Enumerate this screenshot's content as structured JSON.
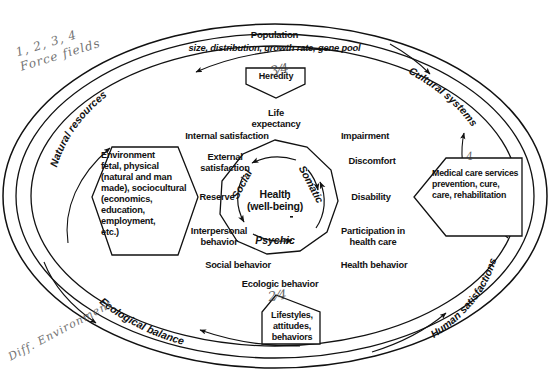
{
  "figure": {
    "type": "conceptual-diagram",
    "title_visible": false
  },
  "outer_ring": {
    "labels": [
      {
        "id": "natural-resources",
        "text": "Natural resources"
      },
      {
        "id": "cultural-systems",
        "text": "Cultural systems"
      },
      {
        "id": "ecological-balance",
        "text": "Ecological balance"
      },
      {
        "id": "human-satisfactions",
        "text": "Human satisfactions"
      }
    ]
  },
  "population": {
    "title": "Population",
    "subtitle": "size, distribution, growth rate, gene pool"
  },
  "inputs": {
    "heredity": {
      "label": "Heredity"
    },
    "environment": {
      "label": "Environment\nfetal, physical\n(natural and man\nmade), sociocultural\n(economics,\neducation,\nemployment,\netc.)"
    },
    "medical_care": {
      "label": "Medical care services\nprevention, cure,\ncare, rehabilitation"
    },
    "lifestyles": {
      "label": "Lifestyles,\nattitudes,\nbehaviors"
    }
  },
  "center": {
    "health_line1": "Health",
    "health_line2": "(well-being)",
    "dimensions": [
      {
        "id": "social",
        "text": "Social"
      },
      {
        "id": "somatic",
        "text": "Somatic"
      },
      {
        "id": "psychic",
        "text": "Psychic"
      }
    ]
  },
  "outcomes": {
    "top": "Life\nexpectancy",
    "bottom": "Ecologic behavior",
    "left": [
      {
        "id": "internal-satisfaction",
        "text": "Internal satisfaction"
      },
      {
        "id": "external-satisfaction",
        "text": "External\nsatisfaction"
      },
      {
        "id": "reserve",
        "text": "Reserve"
      },
      {
        "id": "interpersonal-behavior",
        "text": "Interpersonal\nbehavior"
      },
      {
        "id": "social-behavior",
        "text": "Social behavior"
      }
    ],
    "right": [
      {
        "id": "impairment",
        "text": "Impairment"
      },
      {
        "id": "discomfort",
        "text": "Discomfort"
      },
      {
        "id": "disability",
        "text": "Disability"
      },
      {
        "id": "participation-in-health-care",
        "text": "Participation in\nhealth care"
      },
      {
        "id": "health-behavior",
        "text": "Health behavior"
      }
    ]
  },
  "annotations": {
    "top_left": "1, 2, 3, 4\nForce fields",
    "bottom_left": "Diff. Environment"
  },
  "colors": {
    "ink": "#111111",
    "paper": "#ffffff",
    "pencil": "#5a5a5a"
  }
}
